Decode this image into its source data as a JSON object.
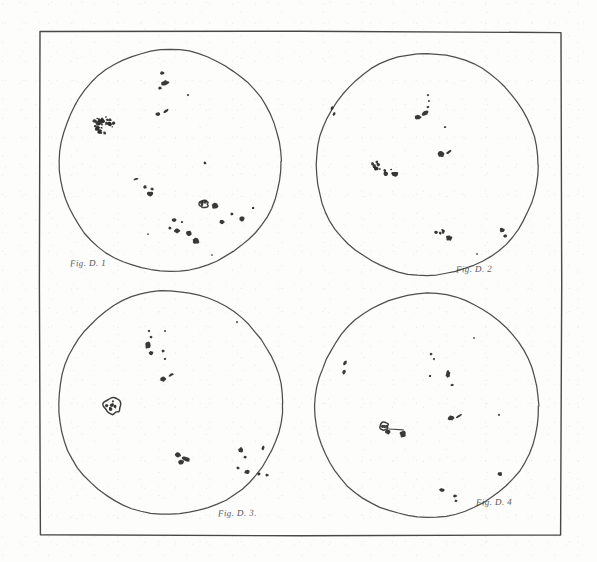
{
  "plate": {
    "title": "Four solar disk drawings with sunspots",
    "background_color": "#fdfdfc",
    "ink_color": "#2a2a28",
    "border": {
      "x": 40,
      "y": 32,
      "width": 521,
      "height": 503,
      "stroke": "#2f2f2d",
      "stroke_width": 1.4
    }
  },
  "captions": [
    {
      "name": "caption-figure-1",
      "text": "Fig. D. 1",
      "x": 70,
      "y": 258
    },
    {
      "name": "caption-figure-2",
      "text": "Fig. D. 2",
      "x": 456,
      "y": 264
    },
    {
      "name": "caption-figure-3",
      "text": "Fig. D. 3.",
      "x": 218,
      "y": 508
    },
    {
      "name": "caption-figure-4",
      "text": "Fig. D. 4",
      "x": 476,
      "y": 497
    }
  ],
  "disks": [
    {
      "name": "solar-disk-1",
      "label": "Fig. D. 1",
      "cx": 170,
      "cy": 161,
      "r": 111,
      "stroke": "#2f2f2d",
      "spot_count": 26,
      "spots": [
        {
          "x": 162,
          "y": 73,
          "rx": 2.0,
          "ry": 1.8,
          "rot": 0
        },
        {
          "x": 165,
          "y": 83,
          "rx": 4.0,
          "ry": 2.2,
          "rot": -12
        },
        {
          "x": 160,
          "y": 88,
          "rx": 1.8,
          "ry": 1.6,
          "rot": 0
        },
        {
          "x": 188,
          "y": 95,
          "rx": 1.1,
          "ry": 1.0,
          "rot": 0
        },
        {
          "x": 158,
          "y": 114,
          "rx": 2.4,
          "ry": 2.0,
          "rot": 0
        },
        {
          "x": 166,
          "y": 111,
          "rx": 3.0,
          "ry": 1.2,
          "rot": -40
        },
        {
          "x": 104,
          "y": 125,
          "rx": 10.5,
          "ry": 8.5,
          "rot": 10,
          "cluster": true
        },
        {
          "x": 205,
          "y": 163,
          "rx": 1.5,
          "ry": 1.4,
          "rot": 0
        },
        {
          "x": 136,
          "y": 179,
          "rx": 2.4,
          "ry": 1.0,
          "rot": -15
        },
        {
          "x": 145,
          "y": 187,
          "rx": 1.8,
          "ry": 1.7,
          "rot": 0
        },
        {
          "x": 152,
          "y": 189,
          "rx": 1.6,
          "ry": 1.5,
          "rot": 0
        },
        {
          "x": 150,
          "y": 194,
          "rx": 3.0,
          "ry": 2.6,
          "rot": 0
        },
        {
          "x": 204,
          "y": 204,
          "rx": 4.2,
          "ry": 3.8,
          "rot": 0,
          "ring": true
        },
        {
          "x": 215,
          "y": 206,
          "rx": 3.4,
          "ry": 3.0,
          "rot": 0
        },
        {
          "x": 253,
          "y": 208,
          "rx": 1.3,
          "ry": 1.2,
          "rot": 0
        },
        {
          "x": 232,
          "y": 214,
          "rx": 1.5,
          "ry": 1.4,
          "rot": 0
        },
        {
          "x": 242,
          "y": 219,
          "rx": 2.6,
          "ry": 2.4,
          "rot": 0
        },
        {
          "x": 174,
          "y": 220,
          "rx": 2.3,
          "ry": 1.8,
          "rot": 0
        },
        {
          "x": 182,
          "y": 222,
          "rx": 1.2,
          "ry": 1.1,
          "rot": 0
        },
        {
          "x": 222,
          "y": 222,
          "rx": 2.4,
          "ry": 2.2,
          "rot": 0
        },
        {
          "x": 170,
          "y": 228,
          "rx": 1.5,
          "ry": 1.4,
          "rot": 0
        },
        {
          "x": 177,
          "y": 231,
          "rx": 2.8,
          "ry": 2.4,
          "rot": 0
        },
        {
          "x": 189,
          "y": 233,
          "rx": 3.0,
          "ry": 2.6,
          "rot": 0
        },
        {
          "x": 196,
          "y": 241,
          "rx": 3.4,
          "ry": 3.0,
          "rot": 0
        },
        {
          "x": 148,
          "y": 234,
          "rx": 0.8,
          "ry": 0.8,
          "rot": 0
        },
        {
          "x": 212,
          "y": 255,
          "rx": 0.8,
          "ry": 0.8,
          "rot": 0
        }
      ]
    },
    {
      "name": "solar-disk-2",
      "label": "Fig. D. 2",
      "cx": 427,
      "cy": 165,
      "r": 111,
      "stroke": "#2f2f2d",
      "spot_count": 18,
      "spots": [
        {
          "x": 332,
          "y": 108,
          "rx": 1.3,
          "ry": 2.0,
          "rot": 25
        },
        {
          "x": 334,
          "y": 114,
          "rx": 1.2,
          "ry": 1.8,
          "rot": 25
        },
        {
          "x": 428,
          "y": 95,
          "rx": 1.1,
          "ry": 1.0,
          "rot": 0
        },
        {
          "x": 429,
          "y": 101,
          "rx": 1.1,
          "ry": 1.0,
          "rot": 0
        },
        {
          "x": 428,
          "y": 107,
          "rx": 1.3,
          "ry": 1.2,
          "rot": 0
        },
        {
          "x": 425,
          "y": 113,
          "rx": 3.4,
          "ry": 2.2,
          "rot": -25
        },
        {
          "x": 418,
          "y": 117,
          "rx": 3.0,
          "ry": 2.4,
          "rot": 0
        },
        {
          "x": 445,
          "y": 127,
          "rx": 1.1,
          "ry": 1.0,
          "rot": 0
        },
        {
          "x": 441,
          "y": 154,
          "rx": 3.4,
          "ry": 2.8,
          "rot": 0
        },
        {
          "x": 449,
          "y": 152,
          "rx": 3.2,
          "ry": 1.1,
          "rot": -35
        },
        {
          "x": 378,
          "y": 165,
          "rx": 5.5,
          "ry": 4.5,
          "rot": 15,
          "cluster": true
        },
        {
          "x": 389,
          "y": 172,
          "rx": 4.5,
          "ry": 3.6,
          "rot": 15,
          "cluster": true
        },
        {
          "x": 395,
          "y": 174,
          "rx": 3.0,
          "ry": 2.6,
          "rot": 0
        },
        {
          "x": 440,
          "y": 232,
          "rx": 4.5,
          "ry": 3.2,
          "rot": -10,
          "cluster": true
        },
        {
          "x": 449,
          "y": 238,
          "rx": 3.2,
          "ry": 2.8,
          "rot": 0
        },
        {
          "x": 502,
          "y": 230,
          "rx": 2.4,
          "ry": 2.2,
          "rot": 0
        },
        {
          "x": 505,
          "y": 236,
          "rx": 1.8,
          "ry": 1.6,
          "rot": 0
        },
        {
          "x": 477,
          "y": 254,
          "rx": 0.9,
          "ry": 0.9,
          "rot": 0
        }
      ]
    },
    {
      "name": "solar-disk-3",
      "label": "Fig. D. 3.",
      "cx": 170,
      "cy": 403,
      "r": 112,
      "stroke": "#2f2f2d",
      "spot_count": 21,
      "spots": [
        {
          "x": 149,
          "y": 331,
          "rx": 1.2,
          "ry": 1.1,
          "rot": 0
        },
        {
          "x": 151,
          "y": 337,
          "rx": 1.4,
          "ry": 1.3,
          "rot": 0
        },
        {
          "x": 165,
          "y": 331,
          "rx": 1.0,
          "ry": 1.0,
          "rot": 0
        },
        {
          "x": 237,
          "y": 322,
          "rx": 1.0,
          "ry": 1.0,
          "rot": 0
        },
        {
          "x": 148,
          "y": 345,
          "rx": 2.6,
          "ry": 3.6,
          "rot": 10
        },
        {
          "x": 151,
          "y": 353,
          "rx": 2.2,
          "ry": 2.0,
          "rot": 0
        },
        {
          "x": 163,
          "y": 351,
          "rx": 1.6,
          "ry": 1.5,
          "rot": 0
        },
        {
          "x": 165,
          "y": 359,
          "rx": 1.2,
          "ry": 1.1,
          "rot": 0
        },
        {
          "x": 163,
          "y": 379,
          "rx": 2.8,
          "ry": 2.4,
          "rot": 0
        },
        {
          "x": 171,
          "y": 375,
          "rx": 3.0,
          "ry": 1.1,
          "rot": -30
        },
        {
          "x": 113,
          "y": 406,
          "rx": 9.0,
          "ry": 8.0,
          "rot": 0,
          "ring": true
        },
        {
          "x": 178,
          "y": 455,
          "rx": 3.2,
          "ry": 2.6,
          "rot": 0
        },
        {
          "x": 186,
          "y": 459,
          "rx": 4.4,
          "ry": 2.0,
          "rot": 25
        },
        {
          "x": 181,
          "y": 462,
          "rx": 2.8,
          "ry": 2.4,
          "rot": 0
        },
        {
          "x": 238,
          "y": 468,
          "rx": 1.6,
          "ry": 1.4,
          "rot": 0
        },
        {
          "x": 247,
          "y": 472,
          "rx": 2.6,
          "ry": 2.2,
          "rot": 0
        },
        {
          "x": 259,
          "y": 474,
          "rx": 1.7,
          "ry": 1.5,
          "rot": 0
        },
        {
          "x": 267,
          "y": 475,
          "rx": 1.6,
          "ry": 1.4,
          "rot": 0
        },
        {
          "x": 241,
          "y": 450,
          "rx": 2.4,
          "ry": 2.8,
          "rot": 0
        },
        {
          "x": 245,
          "y": 457,
          "rx": 1.6,
          "ry": 1.4,
          "rot": 0
        },
        {
          "x": 263,
          "y": 448,
          "rx": 1.5,
          "ry": 2.2,
          "rot": 10
        }
      ]
    },
    {
      "name": "solar-disk-4",
      "label": "Fig. D. 4",
      "cx": 427,
      "cy": 406,
      "r": 112,
      "stroke": "#2f2f2d",
      "spot_count": 19,
      "spots": [
        {
          "x": 345,
          "y": 363,
          "rx": 1.6,
          "ry": 2.6,
          "rot": 15
        },
        {
          "x": 344,
          "y": 372,
          "rx": 1.6,
          "ry": 2.4,
          "rot": 15
        },
        {
          "x": 431,
          "y": 354,
          "rx": 1.5,
          "ry": 1.3,
          "rot": 0
        },
        {
          "x": 434,
          "y": 359,
          "rx": 1.1,
          "ry": 1.0,
          "rot": 0
        },
        {
          "x": 448,
          "y": 374,
          "rx": 2.2,
          "ry": 3.6,
          "rot": 8
        },
        {
          "x": 430,
          "y": 376,
          "rx": 1.3,
          "ry": 1.2,
          "rot": 0
        },
        {
          "x": 452,
          "y": 385,
          "rx": 1.6,
          "ry": 1.2,
          "rot": 0
        },
        {
          "x": 474,
          "y": 338,
          "rx": 0.9,
          "ry": 0.9,
          "rot": 0
        },
        {
          "x": 451,
          "y": 418,
          "rx": 3.2,
          "ry": 2.4,
          "rot": 0
        },
        {
          "x": 459,
          "y": 416,
          "rx": 3.4,
          "ry": 1.1,
          "rot": -32
        },
        {
          "x": 384,
          "y": 426,
          "rx": 4.2,
          "ry": 4.0,
          "rot": 0,
          "ring": true
        },
        {
          "x": 388,
          "y": 432,
          "rx": 2.6,
          "ry": 2.2,
          "rot": 0
        },
        {
          "x": 403,
          "y": 434,
          "rx": 3.0,
          "ry": 3.4,
          "rot": 0
        },
        {
          "x": 396,
          "y": 429,
          "rx": 7.5,
          "ry": 0.9,
          "rot": 8,
          "bridge": true
        },
        {
          "x": 499,
          "y": 415,
          "rx": 1.0,
          "ry": 1.0,
          "rot": 0
        },
        {
          "x": 442,
          "y": 490,
          "rx": 2.8,
          "ry": 1.8,
          "rot": 0
        },
        {
          "x": 455,
          "y": 496,
          "rx": 1.8,
          "ry": 1.5,
          "rot": 0
        },
        {
          "x": 456,
          "y": 501,
          "rx": 1.4,
          "ry": 1.2,
          "rot": 0
        },
        {
          "x": 500,
          "y": 474,
          "rx": 2.4,
          "ry": 2.2,
          "rot": 0
        }
      ]
    }
  ]
}
